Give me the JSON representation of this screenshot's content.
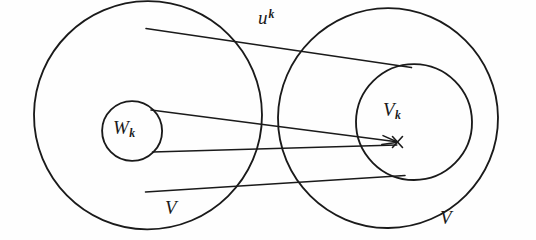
{
  "figure": {
    "kind": "set-inclusion-mapping-diagram",
    "background_color": "#fefefe",
    "ink_color": "#1a1a1a",
    "width": 536,
    "height": 240,
    "labels": {
      "map_base": "u",
      "map_exponent": "k",
      "source_inner_base": "W",
      "source_inner_sub": "k",
      "target_inner_base": "V",
      "target_inner_sub": "k",
      "source_outer": "V",
      "target_outer": "V"
    },
    "shapes": {
      "left_outer_circle": {
        "cx": 148,
        "cy": 115,
        "r": 114
      },
      "left_inner_circle": {
        "cx": 132,
        "cy": 131,
        "r": 30
      },
      "right_outer_circle": {
        "cx": 388,
        "cy": 118,
        "r": 110
      },
      "right_inner_circle": {
        "cx": 414,
        "cy": 122,
        "r": 58
      },
      "arrow_target_point": {
        "x": 397,
        "y": 142
      }
    },
    "connectors": [
      {
        "name": "upper-connector",
        "x1": 147,
        "y1": 29,
        "x2": 411,
        "y2": 68
      },
      {
        "name": "middle-connector",
        "x1": 152,
        "y1": 110,
        "x2": 397,
        "y2": 142
      },
      {
        "name": "lower-connector",
        "x1": 146,
        "y1": 192,
        "x2": 404,
        "y2": 176
      },
      {
        "name": "inner-lower-connector",
        "x1": 153,
        "y1": 152,
        "x2": 397,
        "y2": 145
      }
    ]
  }
}
